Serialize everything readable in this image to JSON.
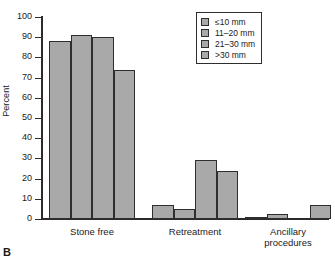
{
  "panel": {
    "letter": "B"
  },
  "chart_data": {
    "type": "bar",
    "title": "",
    "xlabel": "",
    "ylabel": "Percent",
    "ylim": [
      0,
      100
    ],
    "ytick_step": 10,
    "yticks": [
      0,
      10,
      20,
      30,
      40,
      50,
      60,
      70,
      80,
      90,
      100
    ],
    "grid": false,
    "legend_position": "top-right",
    "categories": [
      "Stone free",
      "Retreatment",
      "Ancillary procedures"
    ],
    "category_labels": [
      "Stone free",
      "Retreatment",
      "Ancillary\nprocedures"
    ],
    "series": [
      {
        "name": "≤10 mm",
        "values": [
          88,
          7,
          0.5
        ]
      },
      {
        "name": "11–20 mm",
        "values": [
          91,
          5,
          2.5
        ]
      },
      {
        "name": "21–30 mm",
        "values": [
          90,
          29,
          0
        ]
      },
      {
        "name": ">30 mm",
        "values": [
          74,
          24,
          7
        ]
      }
    ],
    "colors": {
      "bar_fill": "#a9a9a9",
      "bar_edge": "#2e2e2e",
      "axis": "#2b2b2b",
      "text": "#1a1a1a",
      "background": "#ffffff"
    }
  }
}
